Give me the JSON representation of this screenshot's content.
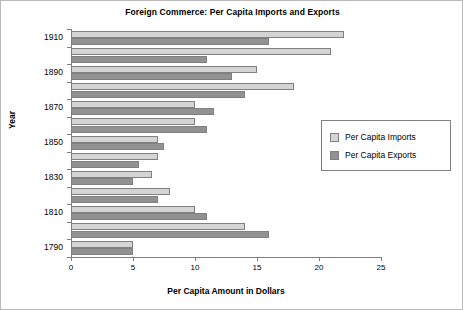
{
  "chart_data": {
    "type": "bar",
    "orientation": "horizontal",
    "title": "Foreign Commerce: Per Capita Imports and Exports",
    "xlabel": "Per Capita Amount in Dollars",
    "ylabel": "Year",
    "xlim": [
      0,
      25
    ],
    "xticks": [
      "0",
      "5",
      "10",
      "15",
      "20",
      "25"
    ],
    "xtick_values": [
      0,
      5,
      10,
      15,
      20,
      25
    ],
    "ytick_labels": [
      "1910",
      "1890",
      "1870",
      "1850",
      "1830",
      "1810",
      "1790"
    ],
    "grid": false,
    "legend_position": "right",
    "categories": [
      "1910",
      "1900",
      "1890",
      "1880",
      "1870",
      "1860",
      "1850",
      "1840",
      "1830",
      "1820",
      "1810",
      "1800",
      "1790"
    ],
    "series": [
      {
        "name": "Per Capita Imports",
        "color": "#d4d4d4",
        "values": [
          22,
          21,
          15,
          18,
          10,
          10,
          7,
          7,
          6.5,
          8,
          10,
          14,
          5
        ]
      },
      {
        "name": "Per Capita Exports",
        "color": "#919191",
        "values": [
          16,
          11,
          13,
          14,
          11.5,
          11,
          7.5,
          5.5,
          5,
          7,
          11,
          16,
          5
        ]
      }
    ]
  },
  "legend": {
    "items": [
      {
        "label": "Per Capita Imports",
        "swatch": "imports"
      },
      {
        "label": "Per Capita Exports",
        "swatch": "exports"
      }
    ]
  }
}
